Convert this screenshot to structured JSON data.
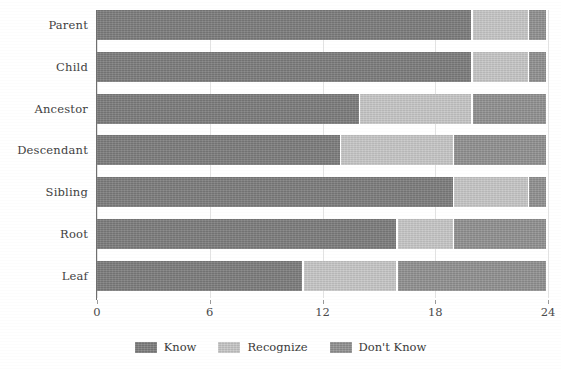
{
  "chart_data": {
    "type": "bar",
    "orientation": "horizontal",
    "stacked": true,
    "title": "",
    "subtitle": "",
    "xlabel": "",
    "ylabel": "",
    "xlim": [
      0,
      24
    ],
    "xticks": [
      0,
      6,
      12,
      18,
      24
    ],
    "xtick_labels": [
      "0",
      "6",
      "12",
      "18",
      "24"
    ],
    "grid": "vertical",
    "legend_position": "bottom-center",
    "categories": [
      "Parent",
      "Child",
      "Ancestor",
      "Descendant",
      "Sibling",
      "Root",
      "Leaf"
    ],
    "series": [
      {
        "name": "Know",
        "color": "#7c7c7c",
        "values": [
          20,
          20,
          14,
          13,
          19,
          16,
          11
        ]
      },
      {
        "name": "Recognize",
        "color": "#c6c6c6",
        "values": [
          3,
          3,
          6,
          6,
          4,
          3,
          5
        ]
      },
      {
        "name": "Don't Know",
        "color": "#909090",
        "values": [
          1,
          1,
          4,
          5,
          1,
          5,
          8
        ]
      }
    ]
  },
  "legend": {
    "items": [
      {
        "label": "Know",
        "color": "#7c7c7c"
      },
      {
        "label": "Recognize",
        "color": "#c6c6c6"
      },
      {
        "label": "Don't Know",
        "color": "#909090"
      }
    ]
  },
  "axis": {
    "x_tick_labels": [
      "0",
      "6",
      "12",
      "18",
      "24"
    ],
    "y_tick_labels": [
      "Parent",
      "Child",
      "Ancestor",
      "Descendant",
      "Sibling",
      "Root",
      "Leaf"
    ]
  }
}
